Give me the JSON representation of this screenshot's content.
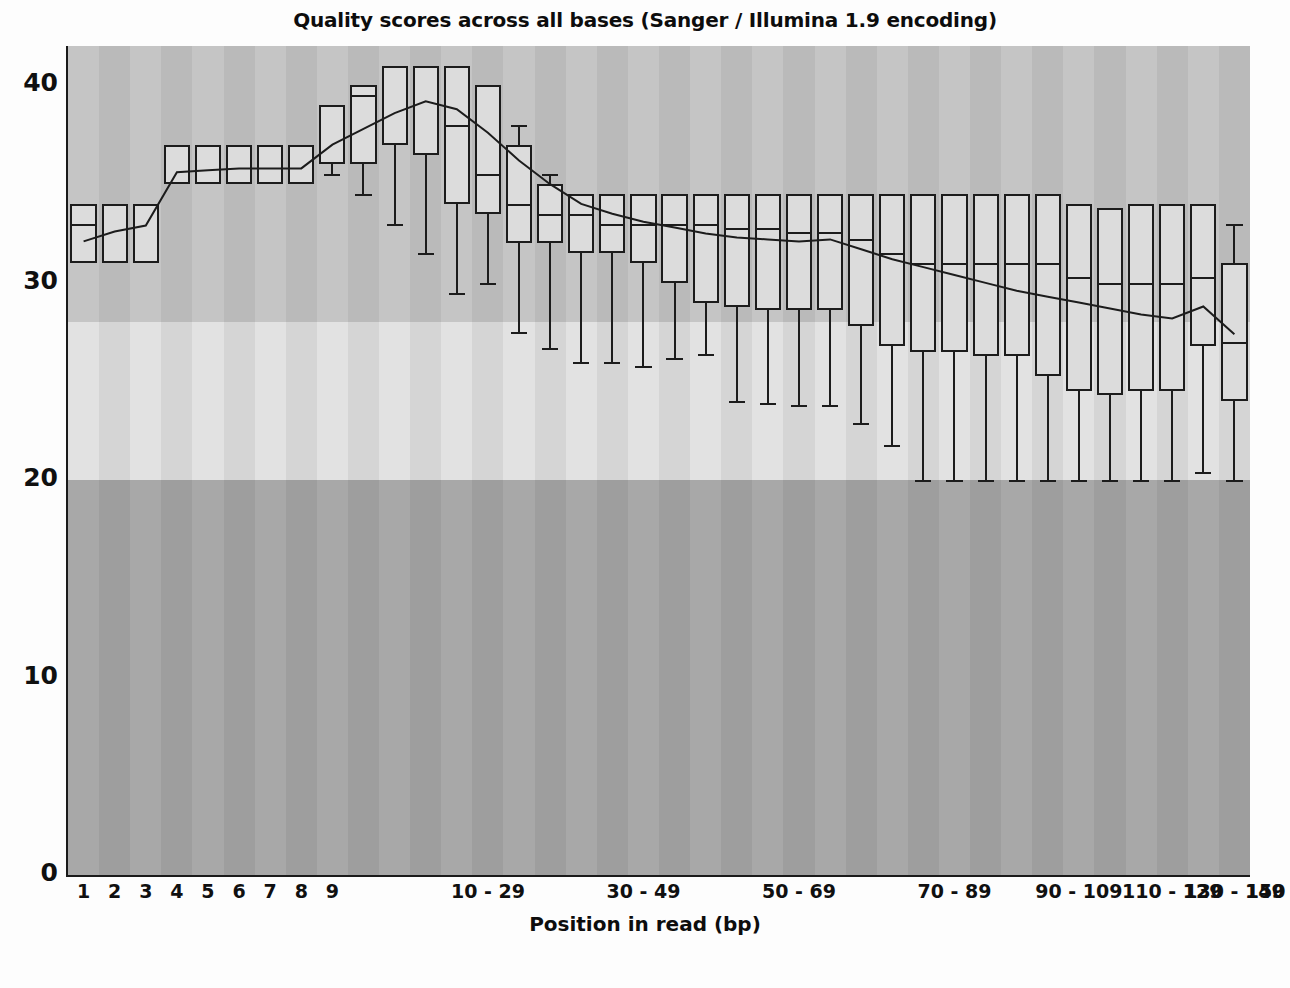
{
  "chart_data": {
    "type": "box",
    "title": "Quality scores across all bases (Sanger / Illumina 1.9 encoding)",
    "xlabel": "Position in read (bp)",
    "ylabel": "",
    "ylim": [
      0,
      42
    ],
    "yticks": [
      0,
      10,
      20,
      30,
      40
    ],
    "ytick_labels": [
      "0",
      "10",
      "20",
      "30",
      "40"
    ],
    "grid": false,
    "legend": null,
    "background_bands": [
      {
        "name": "bad",
        "range": [
          0,
          20
        ],
        "color": "#a8a8a8"
      },
      {
        "name": "reasonable",
        "range": [
          20,
          28
        ],
        "color": "#e2e2e2"
      },
      {
        "name": "good",
        "range": [
          28,
          42
        ],
        "color": "#c5c5c5"
      }
    ],
    "xtick_labels": [
      "1",
      "2",
      "3",
      "4",
      "5",
      "6",
      "7",
      "8",
      "9",
      "10 - 29",
      "30 - 49",
      "50 - 69",
      "70 - 89",
      "90 - 109",
      "110 - 129",
      "130 - 149",
      "150"
    ],
    "xtick_label_positions": [
      0,
      1,
      2,
      3,
      4,
      5,
      6,
      7,
      8,
      13,
      18,
      23,
      28,
      32,
      35,
      37,
      38
    ],
    "categories": [
      "1",
      "2",
      "3",
      "4",
      "5",
      "6",
      "7",
      "8",
      "9",
      "10-14",
      "15-19",
      "20-24",
      "25-29",
      "30-34",
      "35-39",
      "40-44",
      "45-49",
      "50-54",
      "55-59",
      "60-64",
      "65-69",
      "70-74",
      "75-79",
      "80-84",
      "85-89",
      "90-94",
      "95-99",
      "100-104",
      "105-109",
      "110-114",
      "115-119",
      "120-124",
      "125-129",
      "130-134",
      "135-139",
      "140-144",
      "145-149",
      "150"
    ],
    "series": [
      {
        "name": "mean quality",
        "type": "line",
        "values": [
          32.1,
          32.6,
          32.9,
          35.6,
          35.7,
          35.8,
          35.8,
          35.8,
          37.0,
          37.8,
          38.6,
          39.2,
          38.8,
          37.6,
          36.2,
          35.0,
          34.0,
          33.5,
          33.1,
          32.8,
          32.5,
          32.3,
          32.2,
          32.1,
          32.2,
          31.7,
          31.2,
          30.8,
          30.4,
          30.0,
          29.6,
          29.3,
          29.0,
          28.7,
          28.4,
          28.2,
          28.8,
          27.4
        ]
      }
    ],
    "boxes": [
      {
        "x": "1",
        "whisker_low": 31.0,
        "q1": 31.0,
        "median": 33.0,
        "q3": 34.0,
        "whisker_high": 34.0
      },
      {
        "x": "2",
        "whisker_low": 31.0,
        "q1": 31.0,
        "median": 34.0,
        "q3": 34.0,
        "whisker_high": 34.0
      },
      {
        "x": "3",
        "whisker_low": 31.0,
        "q1": 31.0,
        "median": 34.0,
        "q3": 34.0,
        "whisker_high": 34.0
      },
      {
        "x": "4",
        "whisker_low": 35.0,
        "q1": 35.0,
        "median": 37.0,
        "q3": 37.0,
        "whisker_high": 37.0
      },
      {
        "x": "5",
        "whisker_low": 35.0,
        "q1": 35.0,
        "median": 37.0,
        "q3": 37.0,
        "whisker_high": 37.0
      },
      {
        "x": "6",
        "whisker_low": 35.0,
        "q1": 35.0,
        "median": 37.0,
        "q3": 37.0,
        "whisker_high": 37.0
      },
      {
        "x": "7",
        "whisker_low": 35.0,
        "q1": 35.0,
        "median": 37.0,
        "q3": 37.0,
        "whisker_high": 37.0
      },
      {
        "x": "8",
        "whisker_low": 35.0,
        "q1": 35.0,
        "median": 37.0,
        "q3": 37.0,
        "whisker_high": 37.0
      },
      {
        "x": "9",
        "whisker_low": 35.5,
        "q1": 36.0,
        "median": 39.0,
        "q3": 39.0,
        "whisker_high": 39.0
      },
      {
        "x": "10-14",
        "whisker_low": 34.5,
        "q1": 36.0,
        "median": 39.5,
        "q3": 40.0,
        "whisker_high": 40.0
      },
      {
        "x": "15-19",
        "whisker_low": 33.0,
        "q1": 37.0,
        "median": 41.0,
        "q3": 41.0,
        "whisker_high": 41.0
      },
      {
        "x": "20-24",
        "whisker_low": 31.5,
        "q1": 36.5,
        "median": 41.0,
        "q3": 41.0,
        "whisker_high": 41.0
      },
      {
        "x": "25-29",
        "whisker_low": 29.5,
        "q1": 34.0,
        "median": 38.0,
        "q3": 41.0,
        "whisker_high": 41.0
      },
      {
        "x": "30-34",
        "whisker_low": 30.0,
        "q1": 33.5,
        "median": 35.5,
        "q3": 40.0,
        "whisker_high": 40.0
      },
      {
        "x": "35-39",
        "whisker_low": 27.5,
        "q1": 32.0,
        "median": 34.0,
        "q3": 37.0,
        "whisker_high": 38.0
      },
      {
        "x": "40-44",
        "whisker_low": 26.7,
        "q1": 32.0,
        "median": 33.5,
        "q3": 35.0,
        "whisker_high": 35.5
      },
      {
        "x": "45-49",
        "whisker_low": 26.0,
        "q1": 31.5,
        "median": 33.5,
        "q3": 34.5,
        "whisker_high": 34.5
      },
      {
        "x": "50-54",
        "whisker_low": 26.0,
        "q1": 31.5,
        "median": 33.0,
        "q3": 34.5,
        "whisker_high": 34.5
      },
      {
        "x": "55-59",
        "whisker_low": 25.8,
        "q1": 31.0,
        "median": 33.0,
        "q3": 34.5,
        "whisker_high": 34.5
      },
      {
        "x": "60-64",
        "whisker_low": 26.2,
        "q1": 30.0,
        "median": 33.0,
        "q3": 34.5,
        "whisker_high": 34.5
      },
      {
        "x": "65-69",
        "whisker_low": 26.4,
        "q1": 29.0,
        "median": 33.0,
        "q3": 34.5,
        "whisker_high": 34.5
      },
      {
        "x": "70-74",
        "whisker_low": 24.0,
        "q1": 28.8,
        "median": 32.8,
        "q3": 34.5,
        "whisker_high": 34.5
      },
      {
        "x": "75-79",
        "whisker_low": 23.9,
        "q1": 28.6,
        "median": 32.8,
        "q3": 34.5,
        "whisker_high": 34.5
      },
      {
        "x": "80-84",
        "whisker_low": 23.8,
        "q1": 28.6,
        "median": 32.6,
        "q3": 34.5,
        "whisker_high": 34.5
      },
      {
        "x": "85-89",
        "whisker_low": 23.8,
        "q1": 28.6,
        "median": 32.6,
        "q3": 34.5,
        "whisker_high": 34.5
      },
      {
        "x": "90-94",
        "whisker_low": 22.9,
        "q1": 27.8,
        "median": 32.2,
        "q3": 34.5,
        "whisker_high": 34.5
      },
      {
        "x": "95-99",
        "whisker_low": 21.8,
        "q1": 26.8,
        "median": 31.5,
        "q3": 34.5,
        "whisker_high": 34.5
      },
      {
        "x": "100-104",
        "whisker_low": 20.0,
        "q1": 26.5,
        "median": 31.0,
        "q3": 34.5,
        "whisker_high": 34.5
      },
      {
        "x": "105-109",
        "whisker_low": 20.0,
        "q1": 26.5,
        "median": 31.0,
        "q3": 34.5,
        "whisker_high": 34.5
      },
      {
        "x": "110-114",
        "whisker_low": 20.0,
        "q1": 26.3,
        "median": 31.0,
        "q3": 34.5,
        "whisker_high": 34.5
      },
      {
        "x": "115-119",
        "whisker_low": 20.0,
        "q1": 26.3,
        "median": 31.0,
        "q3": 34.5,
        "whisker_high": 34.5
      },
      {
        "x": "120-124",
        "whisker_low": 20.0,
        "q1": 25.3,
        "median": 31.0,
        "q3": 34.5,
        "whisker_high": 34.5
      },
      {
        "x": "125-129",
        "whisker_low": 20.0,
        "q1": 24.5,
        "median": 30.3,
        "q3": 34.0,
        "whisker_high": 34.0
      },
      {
        "x": "130-134",
        "whisker_low": 20.0,
        "q1": 24.3,
        "median": 30.0,
        "q3": 33.8,
        "whisker_high": 33.8
      },
      {
        "x": "135-139",
        "whisker_low": 20.0,
        "q1": 24.5,
        "median": 30.0,
        "q3": 34.0,
        "whisker_high": 34.0
      },
      {
        "x": "140-144",
        "whisker_low": 20.0,
        "q1": 24.5,
        "median": 30.0,
        "q3": 34.0,
        "whisker_high": 34.0
      },
      {
        "x": "145-149",
        "whisker_low": 20.4,
        "q1": 26.8,
        "median": 30.3,
        "q3": 34.0,
        "whisker_high": 34.0
      },
      {
        "x": "150",
        "whisker_low": 20.0,
        "q1": 24.0,
        "median": 27.0,
        "q3": 31.0,
        "whisker_high": 33.0
      }
    ]
  }
}
